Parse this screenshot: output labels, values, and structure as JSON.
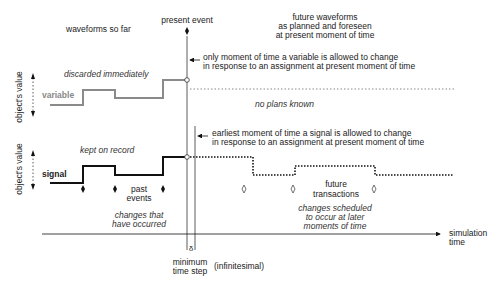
{
  "diagram": {
    "headings": {
      "past": "waveforms so far",
      "present": "present event",
      "future": [
        "future waveforms",
        "as planned and foreseen",
        "at present moment of time"
      ]
    },
    "variable": {
      "label": "variable",
      "axis_label": "object's value",
      "past_note": "discarded immediately",
      "future_note": "no plans known",
      "callout": [
        "only moment of time a variable is allowed to change",
        "in response to an assignment at present moment of time"
      ],
      "color": "#8a8a8a"
    },
    "signal": {
      "label": "signal",
      "axis_label": "object's value",
      "past_note": "kept on record",
      "callout": [
        "earliest moment of time a signal is allowed to change",
        "in response to an assignment at present moment of time"
      ],
      "past_events_label": [
        "past",
        "events"
      ],
      "past_events_note": [
        "changes that",
        "have occurred"
      ],
      "future_label": [
        "future",
        "transactions"
      ],
      "future_note": [
        "changes scheduled",
        "to occur at later",
        "moments of time"
      ],
      "color": "#111111"
    },
    "time_axis": {
      "label": [
        "simulation",
        "time"
      ],
      "delta_symbol": "δ",
      "min_step": [
        "minimum",
        "time step"
      ],
      "min_step_note": "(infinitesimal)"
    }
  }
}
